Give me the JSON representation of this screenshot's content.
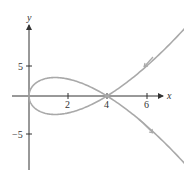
{
  "chart_data": {
    "type": "line",
    "title": "",
    "xlabel": "x",
    "ylabel": "y",
    "x_ticks": [
      2,
      4,
      6
    ],
    "x_tick_labels": [
      "2",
      "4",
      "6"
    ],
    "y_ticks": [
      5,
      -5
    ],
    "y_tick_labels": [
      "5",
      "−5"
    ],
    "xlim": [
      -0.6,
      7.6
    ],
    "ylim": [
      -9.5,
      12.5
    ],
    "grid": false,
    "legend": "none",
    "series": [
      {
        "name": "curve",
        "param": "t",
        "t_range": [
          -2.9,
          2.9
        ],
        "x_expr": "t^2",
        "y_expr": "t^3 - 4t",
        "color": "#a9a9a9",
        "self_intersection": [
          4,
          0
        ]
      }
    ],
    "annotations": [
      {
        "type": "arrow",
        "near": [
          6.1,
          4.2
        ],
        "direction": "down-left"
      },
      {
        "type": "arrow",
        "near": [
          6.1,
          -4.2
        ],
        "direction": "down-right"
      }
    ]
  },
  "labels": {
    "x_axis": "x",
    "y_axis": "y",
    "tick_2": "2",
    "tick_4": "4",
    "tick_6": "6",
    "tick_y5": "5",
    "tick_ym5": "−5"
  },
  "colors": {
    "axis": "#333333",
    "curve": "#a9a9a9"
  }
}
